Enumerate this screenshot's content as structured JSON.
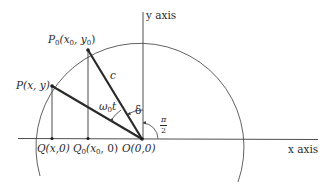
{
  "figure": {
    "type": "geometry-diagram",
    "axes": {
      "x_label": "x axis",
      "y_label": "y axis"
    },
    "points": {
      "P0": {
        "name": "P",
        "sub": "0",
        "coords": "(x",
        "coords_sub": "0",
        "coords_mid": ", y",
        "coords_sub2": "0",
        "coords_end": ")"
      },
      "P": {
        "label": "P(x, y)"
      },
      "Q": {
        "label": "Q(x,0)"
      },
      "Q0": {
        "name": "Q",
        "sub": "0",
        "coords": "(x",
        "coords_sub": "0",
        "coords_end": ", 0)"
      },
      "O": {
        "label": "O(0,0)"
      }
    },
    "segment_labels": {
      "radius": "c"
    },
    "angles": {
      "rotation": {
        "symbol": "ω",
        "sub": "0",
        "var": "t"
      },
      "phase": "δ",
      "right_angle": {
        "numerator": "π",
        "denominator": "2"
      }
    },
    "colors": {
      "line": "#2a2a2a",
      "thin_line": "#3a3a3a",
      "background": "#ffffff"
    }
  }
}
